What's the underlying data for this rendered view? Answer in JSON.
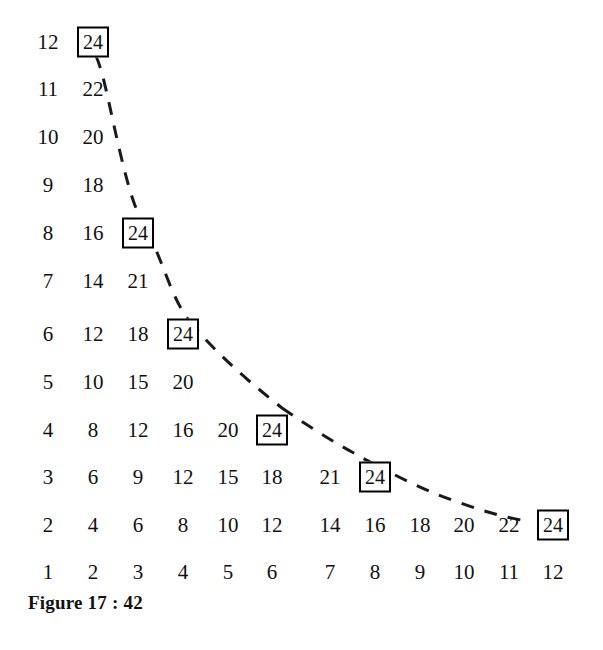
{
  "figure": {
    "caption": "Figure 17 : 42",
    "width": 603,
    "height": 650,
    "background_color": "#ffffff",
    "text_color": "#111111",
    "box_border_color": "#000000",
    "curve_color": "#1a1a1a"
  },
  "chart_data": {
    "type": "table",
    "title": "Figure 17 : 42",
    "xlabel": "",
    "ylabel": "",
    "xlim": [
      1,
      12
    ],
    "ylim": [
      1,
      12
    ],
    "grid": false,
    "legend": null,
    "columns": [
      1,
      2,
      3,
      4,
      5,
      6,
      7,
      8,
      9,
      10,
      11,
      12
    ],
    "rows": [
      1,
      2,
      3,
      4,
      5,
      6,
      7,
      8,
      9,
      10,
      11,
      12
    ],
    "note": "Cell at row r, column c shows the product r*c, but only cells with product <= 24 are printed. Cells whose product equals 24 are drawn inside a rectangle.",
    "highlight_value": 24,
    "cells": [
      {
        "row": 12,
        "values": [
          12,
          24
        ],
        "boxed_index": 1
      },
      {
        "row": 11,
        "values": [
          11,
          22
        ],
        "boxed_index": -1
      },
      {
        "row": 10,
        "values": [
          10,
          20
        ],
        "boxed_index": -1
      },
      {
        "row": 9,
        "values": [
          9,
          18
        ],
        "boxed_index": -1
      },
      {
        "row": 8,
        "values": [
          8,
          16,
          24
        ],
        "boxed_index": 2
      },
      {
        "row": 7,
        "values": [
          7,
          14,
          21
        ],
        "boxed_index": -1
      },
      {
        "row": 6,
        "values": [
          6,
          12,
          18,
          24
        ],
        "boxed_index": 3
      },
      {
        "row": 5,
        "values": [
          5,
          10,
          15,
          20
        ],
        "boxed_index": -1
      },
      {
        "row": 4,
        "values": [
          4,
          8,
          12,
          16,
          20,
          24
        ],
        "boxed_index": 5
      },
      {
        "row": 3,
        "values": [
          3,
          6,
          9,
          12,
          15,
          18,
          21,
          24
        ],
        "boxed_index": 7
      },
      {
        "row": 2,
        "values": [
          2,
          4,
          6,
          8,
          10,
          12,
          14,
          16,
          18,
          20,
          22,
          24
        ],
        "boxed_index": 11
      },
      {
        "row": 1,
        "values": [
          1,
          2,
          3,
          4,
          5,
          6,
          7,
          8,
          9,
          10,
          11,
          12
        ],
        "boxed_index": -1
      }
    ],
    "boxed_points": [
      {
        "x": 2,
        "y": 12,
        "value": 24
      },
      {
        "x": 3,
        "y": 8,
        "value": 24
      },
      {
        "x": 4,
        "y": 6,
        "value": 24
      },
      {
        "x": 6,
        "y": 4,
        "value": 24
      },
      {
        "x": 8,
        "y": 3,
        "value": 24
      },
      {
        "x": 12,
        "y": 2,
        "value": 24
      }
    ],
    "curve": {
      "style": "dashed",
      "equation_label": "xy = 24",
      "passes_through": [
        {
          "x": 2,
          "y": 12
        },
        {
          "x": 3,
          "y": 8
        },
        {
          "x": 4,
          "y": 6
        },
        {
          "x": 6,
          "y": 4
        },
        {
          "x": 8,
          "y": 3
        },
        {
          "x": 12,
          "y": 2
        }
      ]
    }
  },
  "geometry": {
    "col_x": [
      48,
      93,
      138,
      183,
      228,
      272,
      330,
      375,
      420,
      464,
      509,
      553
    ],
    "row_y": [
      572,
      525,
      477,
      430,
      382,
      334,
      281,
      233,
      185,
      137,
      89,
      42
    ]
  }
}
